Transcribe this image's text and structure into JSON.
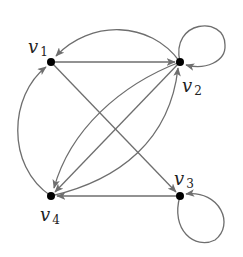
{
  "diagram": {
    "type": "directed-graph",
    "colors": {
      "edge": "#6e6e6e",
      "vertex": "#000000",
      "label": "#222222"
    },
    "vertices": [
      {
        "id": "v1",
        "base": "v",
        "sub": "1"
      },
      {
        "id": "v2",
        "base": "v",
        "sub": "2"
      },
      {
        "id": "v3",
        "base": "v",
        "sub": "3"
      },
      {
        "id": "v4",
        "base": "v",
        "sub": "4"
      }
    ],
    "edges": [
      {
        "from": "v1",
        "to": "v2",
        "shape": "straight"
      },
      {
        "from": "v2",
        "to": "v1",
        "shape": "arc"
      },
      {
        "from": "v2",
        "to": "v2",
        "shape": "loop"
      },
      {
        "from": "v1",
        "to": "v3",
        "shape": "straight"
      },
      {
        "from": "v4",
        "to": "v1",
        "shape": "arc"
      },
      {
        "from": "v2",
        "to": "v4",
        "shape": "arc"
      },
      {
        "from": "v2",
        "to": "v4",
        "shape": "straight"
      },
      {
        "from": "v4",
        "to": "v2",
        "shape": "arc"
      },
      {
        "from": "v3",
        "to": "v4",
        "shape": "straight"
      },
      {
        "from": "v3",
        "to": "v3",
        "shape": "loop"
      }
    ]
  }
}
